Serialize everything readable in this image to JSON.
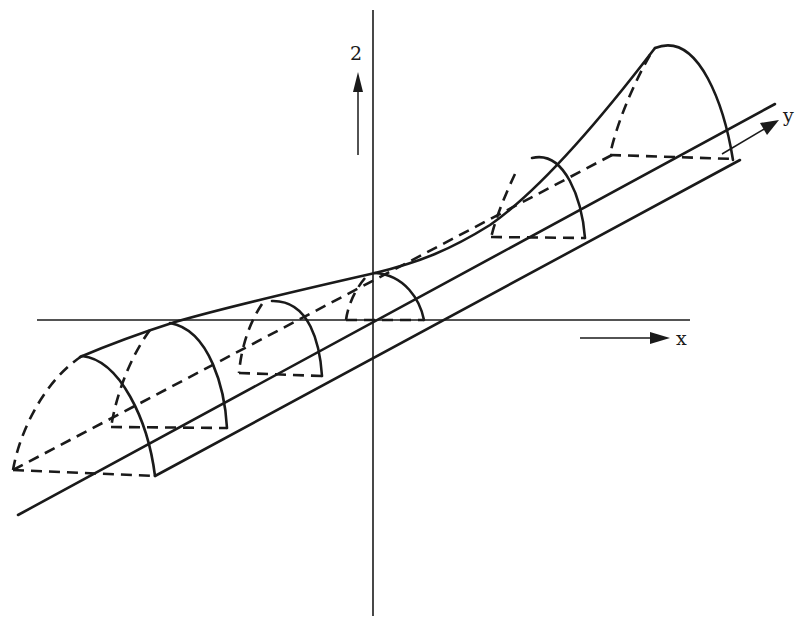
{
  "figure": {
    "type": "3d-schematic",
    "line_color": "#1a1a1a",
    "background": "#ffffff"
  },
  "axes": {
    "z": {
      "label": "z",
      "glyph": "2"
    },
    "x": {
      "label": "x",
      "glyph": "x"
    },
    "y": {
      "label": "y",
      "glyph": "y"
    }
  },
  "cross_sections": [
    {
      "id": 1,
      "position": "far-left"
    },
    {
      "id": 2,
      "position": "left"
    },
    {
      "id": 3,
      "position": "near-left"
    },
    {
      "id": 4,
      "position": "origin"
    },
    {
      "id": 5,
      "position": "near-right"
    },
    {
      "id": 6,
      "position": "far-right"
    }
  ]
}
